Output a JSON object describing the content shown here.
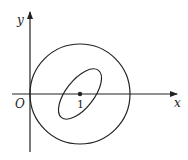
{
  "diagram": {
    "x_axis_label": "x",
    "y_axis_label": "y",
    "origin_label": "O",
    "point_label": "1",
    "elements": [
      "x-axis",
      "y-axis",
      "circle centered at (1,0) passing through origin",
      "tilted ellipse centered at (1,0)",
      "point at (1,0)"
    ],
    "stroke_color": "#222222"
  }
}
